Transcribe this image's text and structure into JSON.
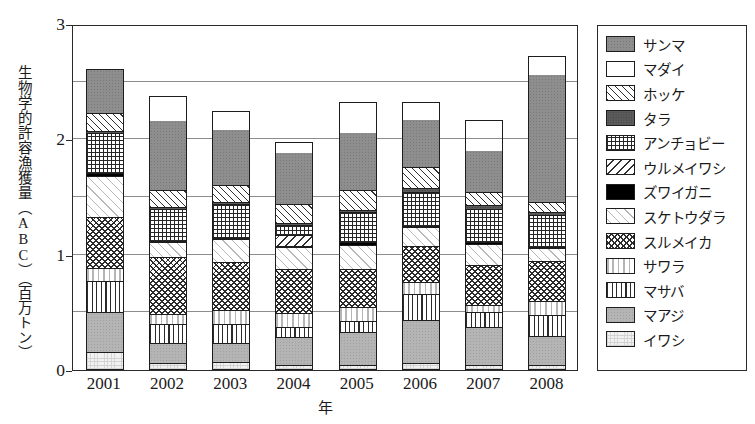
{
  "chart_data": {
    "type": "bar",
    "subtype": "stacked-bar",
    "title": "",
    "xlabel": "年",
    "ylabel": "生物学的許容漁獲量（ABC）（百万トン）",
    "categories": [
      "2001",
      "2002",
      "2003",
      "2004",
      "2005",
      "2006",
      "2007",
      "2008"
    ],
    "ylim": [
      0,
      3
    ],
    "yticks": [
      "0",
      "1",
      "2",
      "3"
    ],
    "ytick_values": [
      0,
      1,
      2,
      3
    ],
    "gridlines": [
      0.5,
      1.0,
      1.5,
      2.0,
      2.5,
      3.0
    ],
    "grid": true,
    "legend_position": "right",
    "stack_order_bottom_to_top": [
      "イワシ",
      "マアジ",
      "マサバ",
      "サワラ",
      "スルメイカ",
      "スケトウダラ",
      "ズワイガニ",
      "ウルメイワシ",
      "アンチョビー",
      "タラ",
      "ホッケ",
      "マダイ",
      "サンマ"
    ],
    "series": [
      {
        "name": "イワシ",
        "pattern": "p-iwashi",
        "values": [
          0.14,
          0.04,
          0.05,
          0.03,
          0.03,
          0.04,
          0.03,
          0.03
        ]
      },
      {
        "name": "マアジ",
        "pattern": "p-maaji",
        "values": [
          0.35,
          0.18,
          0.17,
          0.24,
          0.28,
          0.38,
          0.33,
          0.25
        ]
      },
      {
        "name": "マサバ",
        "pattern": "p-masaba",
        "values": [
          0.27,
          0.16,
          0.16,
          0.09,
          0.1,
          0.22,
          0.13,
          0.18
        ]
      },
      {
        "name": "サワラ",
        "pattern": "p-sawara",
        "values": [
          0.11,
          0.09,
          0.12,
          0.12,
          0.12,
          0.11,
          0.06,
          0.12
        ]
      },
      {
        "name": "スルメイカ",
        "pattern": "p-surume",
        "values": [
          0.45,
          0.49,
          0.42,
          0.38,
          0.33,
          0.31,
          0.34,
          0.35
        ]
      },
      {
        "name": "スケトウダラ",
        "pattern": "p-suketou",
        "values": [
          0.36,
          0.13,
          0.2,
          0.19,
          0.21,
          0.16,
          0.19,
          0.11
        ]
      },
      {
        "name": "ズワイガニ",
        "pattern": "p-zuwai",
        "values": [
          0.02,
          0.01,
          0.01,
          0.01,
          0.02,
          0.01,
          0.01,
          0.01
        ]
      },
      {
        "name": "ウルメイワシ",
        "pattern": "p-urume",
        "values": [
          0.0,
          0.0,
          0.0,
          0.09,
          0.0,
          0.0,
          0.0,
          0.0
        ]
      },
      {
        "name": "アンチョビー",
        "pattern": "p-anchovy",
        "values": [
          0.35,
          0.28,
          0.29,
          0.09,
          0.26,
          0.3,
          0.29,
          0.28
        ]
      },
      {
        "name": "タラ",
        "pattern": "p-tara",
        "values": [
          0.02,
          0.02,
          0.02,
          0.02,
          0.02,
          0.03,
          0.03,
          0.02
        ]
      },
      {
        "name": "ホッケ",
        "pattern": "p-hokke",
        "values": [
          0.16,
          0.14,
          0.15,
          0.16,
          0.17,
          0.18,
          0.12,
          0.09
        ]
      },
      {
        "name": "マダイ",
        "pattern": "p-madai",
        "values": [
          0.0,
          0.0,
          0.0,
          0.0,
          0.0,
          0.0,
          0.0,
          0.0
        ]
      },
      {
        "name": "サンマ",
        "pattern": "p-sanma",
        "values": [
          0.38,
          0.61,
          0.48,
          0.45,
          0.51,
          0.42,
          0.36,
          1.11
        ]
      }
    ],
    "totals": [
      2.61,
      2.38,
      2.25,
      1.98,
      2.32,
      2.32,
      2.17,
      2.72
    ]
  },
  "legend": {
    "items": [
      {
        "label": "サンマ",
        "pattern": "p-sanma"
      },
      {
        "label": "マダイ",
        "pattern": "p-madai"
      },
      {
        "label": "ホッケ",
        "pattern": "p-hokke"
      },
      {
        "label": "タラ",
        "pattern": "p-tara"
      },
      {
        "label": "アンチョビー",
        "pattern": "p-anchovy"
      },
      {
        "label": "ウルメイワシ",
        "pattern": "p-urume"
      },
      {
        "label": "ズワイガニ",
        "pattern": "p-zuwai"
      },
      {
        "label": "スケトウダラ",
        "pattern": "p-suketou"
      },
      {
        "label": "スルメイカ",
        "pattern": "p-surume"
      },
      {
        "label": "サワラ",
        "pattern": "p-sawara"
      },
      {
        "label": "マサバ",
        "pattern": "p-masaba"
      },
      {
        "label": "マアジ",
        "pattern": "p-maaji"
      },
      {
        "label": "イワシ",
        "pattern": "p-iwashi"
      }
    ]
  },
  "colors": {
    "axis": "#2a2a2a",
    "gridline": "#8d8d8d",
    "background": "#ffffff",
    "segment_outline": "#1d1d1d"
  }
}
